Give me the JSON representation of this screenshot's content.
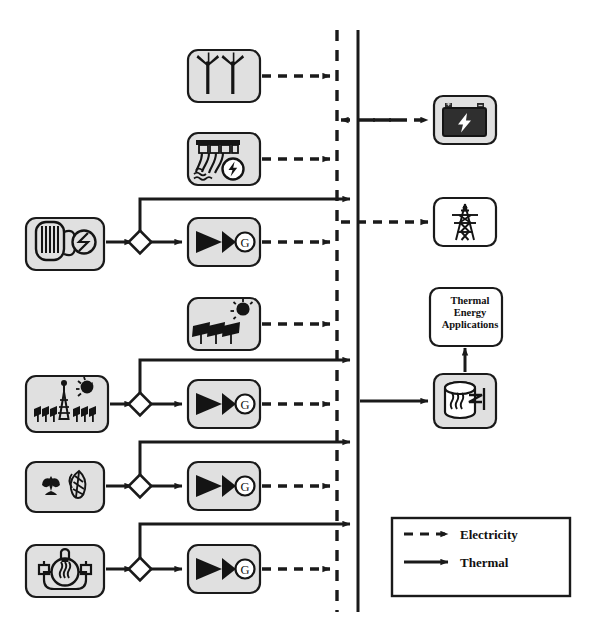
{
  "diagram": {
    "background_color": "#ffffff",
    "box_fill": "#e0e0e0",
    "box_fill_light": "#ffffff",
    "stroke_color": "#1a1a1a",
    "icon_dark": "#141414"
  },
  "buses": [
    {
      "id": "electricity-bus",
      "name": "electricity-bus",
      "style": "dashed",
      "x": 337,
      "y1": 30,
      "y2": 612,
      "label": "Electricity bus"
    },
    {
      "id": "thermal-bus",
      "name": "thermal-bus",
      "style": "solid",
      "x": 358,
      "y1": 30,
      "y2": 612,
      "label": "Thermal bus"
    }
  ],
  "sources": [
    {
      "id": "wind",
      "icon": "wind-turbine-icon",
      "label": "Wind turbines",
      "output": "electricity",
      "x": 188,
      "y": 50,
      "w": 72,
      "h": 52
    },
    {
      "id": "hydro",
      "icon": "hydro-dam-icon",
      "label": "Hydroelectric dam",
      "output": "electricity",
      "x": 188,
      "y": 133,
      "w": 72,
      "h": 52
    },
    {
      "id": "nuclear",
      "icon": "nuclear-reactor-icon",
      "label": "Nuclear reactor",
      "output": "thermal",
      "x": 26,
      "y": 218,
      "w": 78,
      "h": 52
    },
    {
      "id": "solar-pv",
      "icon": "solar-pv-icon",
      "label": "Solar photovoltaic panels",
      "output": "electricity",
      "x": 188,
      "y": 298,
      "w": 72,
      "h": 52
    },
    {
      "id": "solar-thermal",
      "icon": "solar-tower-icon",
      "label": "Concentrated solar power tower",
      "output": "thermal",
      "x": 26,
      "y": 376,
      "w": 82,
      "h": 56
    },
    {
      "id": "biomass",
      "icon": "biomass-icon",
      "label": "Biomass",
      "output": "thermal",
      "x": 26,
      "y": 462,
      "w": 78,
      "h": 50
    },
    {
      "id": "geothermal",
      "icon": "geothermal-icon",
      "label": "Geothermal",
      "output": "thermal",
      "x": 26,
      "y": 545,
      "w": 78,
      "h": 52
    }
  ],
  "converters": [
    {
      "id": "turbine-nuclear",
      "icon": "turbine-generator-icon",
      "label": "Steam turbine generator",
      "generator_label": "G",
      "x": 188,
      "y": 218,
      "w": 72,
      "h": 48
    },
    {
      "id": "turbine-solar",
      "icon": "turbine-generator-icon",
      "label": "Steam turbine generator",
      "generator_label": "G",
      "x": 188,
      "y": 380,
      "w": 72,
      "h": 48
    },
    {
      "id": "turbine-biomass",
      "icon": "turbine-generator-icon",
      "label": "Steam turbine generator",
      "generator_label": "G",
      "x": 188,
      "y": 462,
      "w": 72,
      "h": 48
    },
    {
      "id": "turbine-geothermal",
      "icon": "turbine-generator-icon",
      "label": "Steam turbine generator",
      "generator_label": "G",
      "x": 188,
      "y": 545,
      "w": 72,
      "h": 48
    }
  ],
  "splitters": [
    {
      "id": "split-nuclear",
      "name": "flow-splitter-node",
      "x": 140,
      "y": 242
    },
    {
      "id": "split-solar",
      "name": "flow-splitter-node",
      "x": 140,
      "y": 404
    },
    {
      "id": "split-biomass",
      "name": "flow-splitter-node",
      "x": 140,
      "y": 486
    },
    {
      "id": "split-geothermal",
      "name": "flow-splitter-node",
      "x": 140,
      "y": 569
    }
  ],
  "sinks": [
    {
      "id": "battery",
      "icon": "battery-storage-icon",
      "label": "Battery storage",
      "flow": "electricity",
      "bidirectional": true,
      "x": 434,
      "y": 96,
      "w": 62,
      "h": 48
    },
    {
      "id": "grid",
      "icon": "transmission-tower-icon",
      "label": "Electric grid transmission",
      "flow": "electricity",
      "bidirectional": false,
      "x": 434,
      "y": 198,
      "w": 62,
      "h": 48
    },
    {
      "id": "thermal-storage",
      "icon": "thermal-storage-icon",
      "label": "Thermal energy storage",
      "flow": "thermal",
      "bidirectional": false,
      "x": 434,
      "y": 374,
      "w": 62,
      "h": 54
    }
  ],
  "thermal_applications": {
    "name": "thermal-energy-applications-box",
    "text": "Thermal\nEnergy\nApplications",
    "line1": "Thermal",
    "line2": "Energy",
    "line3": "Applications",
    "x": 430,
    "y": 288,
    "w": 72,
    "h": 56
  },
  "legend": {
    "name": "legend-box",
    "x": 392,
    "y": 518,
    "w": 178,
    "h": 78,
    "items": [
      {
        "id": "legend-electricity",
        "style": "dashed",
        "label": "Electricity"
      },
      {
        "id": "legend-thermal",
        "style": "solid",
        "label": "Thermal"
      }
    ]
  }
}
